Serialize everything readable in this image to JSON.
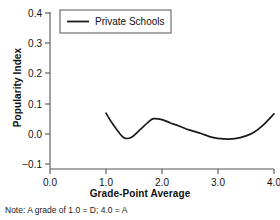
{
  "chart_data": {
    "type": "line",
    "title": "",
    "xlabel": "Grade-Point Average",
    "ylabel": "Popularity Index",
    "xlim": [
      0.0,
      4.0
    ],
    "ylim": [
      -0.1,
      0.4
    ],
    "xticks": [
      "0.0",
      "1.0",
      "2.0",
      "3.0",
      "4.0"
    ],
    "yticks": [
      "0.4",
      "0.3",
      "0.2",
      "0.1",
      "0.0",
      "-0.1"
    ],
    "grid": false,
    "legend_position": "top-left-inside",
    "series": [
      {
        "name": "Private Schools",
        "color": "#1a1a1a",
        "x": [
          1.0,
          1.1,
          1.2,
          1.32,
          1.45,
          1.6,
          1.75,
          1.85,
          2.0,
          2.15,
          2.3,
          2.5,
          2.7,
          2.9,
          3.1,
          3.3,
          3.5,
          3.65,
          3.8,
          4.0
        ],
        "y": [
          0.068,
          0.038,
          0.012,
          -0.013,
          -0.012,
          0.012,
          0.038,
          0.05,
          0.047,
          0.036,
          0.026,
          0.012,
          0.001,
          -0.012,
          -0.017,
          -0.016,
          -0.007,
          0.006,
          0.028,
          0.066
        ]
      }
    ],
    "annotations": {
      "footnote": "Note: A grade of 1.0 = D; 4.0 = A"
    }
  },
  "legend": {
    "entries": [
      {
        "label": "Private Schools"
      }
    ]
  },
  "axes": {
    "y_tick_labels": [
      "0.4",
      "0.3",
      "0.2",
      "0.1",
      "0.0",
      "−0.1"
    ],
    "x_tick_labels": [
      "0.0",
      "1.0",
      "2.0",
      "3.0",
      "4.0"
    ],
    "y_title": "Popularity Index",
    "x_title": "Grade-Point Average"
  },
  "footnote": "Note: A grade of 1.0 = D; 4.0 = A",
  "colors": {
    "line": "#1a1a1a",
    "axis": "#555555",
    "text": "#111111",
    "background": "#ffffff"
  }
}
